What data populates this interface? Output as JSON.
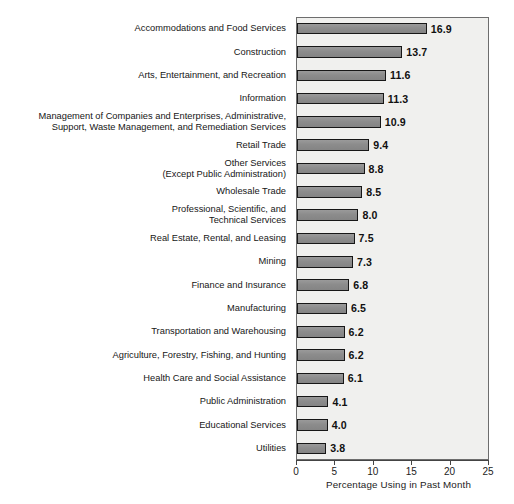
{
  "chart_data": {
    "type": "bar",
    "orientation": "horizontal",
    "title": "",
    "xlabel": "Percentage Using in Past Month",
    "ylabel": "",
    "xlim": [
      0,
      25
    ],
    "xticks": [
      "0",
      "5",
      "10",
      "15",
      "20",
      "25"
    ],
    "grid": false,
    "legend": null,
    "bar_color": "#8f8f8f",
    "bar_border_color": "#171717",
    "plot_background": "#f0f0ee",
    "categories": [
      "Accommodations and Food Services",
      "Construction",
      "Arts, Entertainment, and Recreation",
      "Information",
      "Management of Companies and Enterprises, Administrative,\nSupport, Waste Management, and Remediation Services",
      "Retail Trade",
      "Other Services\n(Except Public Administration)",
      "Wholesale Trade",
      "Professional, Scientific, and\nTechnical Services",
      "Real Estate, Rental, and Leasing",
      "Mining",
      "Finance and Insurance",
      "Manufacturing",
      "Transportation and Warehousing",
      "Agriculture, Forestry, Fishing, and Hunting",
      "Health Care and Social Assistance",
      "Public Administration",
      "Educational Services",
      "Utilities"
    ],
    "values": [
      16.9,
      13.7,
      11.6,
      11.3,
      10.9,
      9.4,
      8.8,
      8.5,
      8.0,
      7.5,
      7.3,
      6.8,
      6.5,
      6.2,
      6.2,
      6.1,
      4.1,
      4.0,
      3.8
    ],
    "value_labels": [
      "16.9",
      "13.7",
      "11.6",
      "11.3",
      "10.9",
      "9.4",
      "8.8",
      "8.5",
      "8.0",
      "7.5",
      "7.3",
      "6.8",
      "6.5",
      "6.2",
      "6.2",
      "6.1",
      "4.1",
      "4.0",
      "3.8"
    ]
  }
}
